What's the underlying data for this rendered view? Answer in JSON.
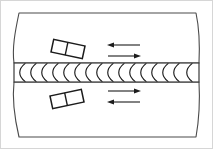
{
  "figure": {
    "width": 213,
    "height": 149,
    "background_color": "#ffffff",
    "frame_color": "#d6d6d6",
    "line_color": "#1c1c1c",
    "plate_stroke_color": "#4a4a4a"
  },
  "plates": [
    {
      "id": "upper-plate",
      "label": "Upper plate",
      "top_y": 13,
      "bottom_y": 63,
      "left_edge": "wavy-break-line",
      "right_edge": "wavy-break-line",
      "fill": "#ffffff"
    },
    {
      "id": "lower-plate",
      "label": "Lower plate",
      "top_y": 82,
      "bottom_y": 137,
      "left_edge": "wavy-break-line",
      "right_edge": "wavy-break-line",
      "fill": "#ffffff"
    }
  ],
  "weld": {
    "id": "weld-bead",
    "label": "Weld bead",
    "band_top_y": 63,
    "band_bottom_y": 82,
    "band_left_x": 14,
    "band_right_x": 199,
    "ripple_count": 16,
    "ripple_shape": "arc",
    "ripple_color": "#1c1c1c"
  },
  "blocks": [
    {
      "id": "upper-block",
      "label": "Upper block",
      "center_x": 68,
      "center_y": 49,
      "width": 32,
      "height": 13,
      "rotation_deg": 12,
      "cells": 2,
      "fill": "#ffffff"
    },
    {
      "id": "lower-block",
      "label": "Lower block",
      "center_x": 67,
      "center_y": 99,
      "width": 32,
      "height": 13,
      "rotation_deg": -12,
      "cells": 2,
      "fill": "#ffffff"
    }
  ],
  "arrows": [
    {
      "id": "arrow-upper-left",
      "label": "Upper region leftward motion",
      "direction": "left",
      "x_start": 140,
      "x_end": 108,
      "y": 45,
      "region": "above-weld"
    },
    {
      "id": "arrow-upper-right",
      "label": "Upper region rightward motion",
      "direction": "right",
      "x_start": 108,
      "x_end": 140,
      "y": 56,
      "region": "above-weld"
    },
    {
      "id": "arrow-lower-right",
      "label": "Lower region rightward motion",
      "direction": "right",
      "x_start": 108,
      "x_end": 140,
      "y": 91,
      "region": "below-weld"
    },
    {
      "id": "arrow-lower-left",
      "label": "Lower region leftward motion",
      "direction": "left",
      "x_start": 140,
      "x_end": 108,
      "y": 102,
      "region": "below-weld"
    }
  ]
}
